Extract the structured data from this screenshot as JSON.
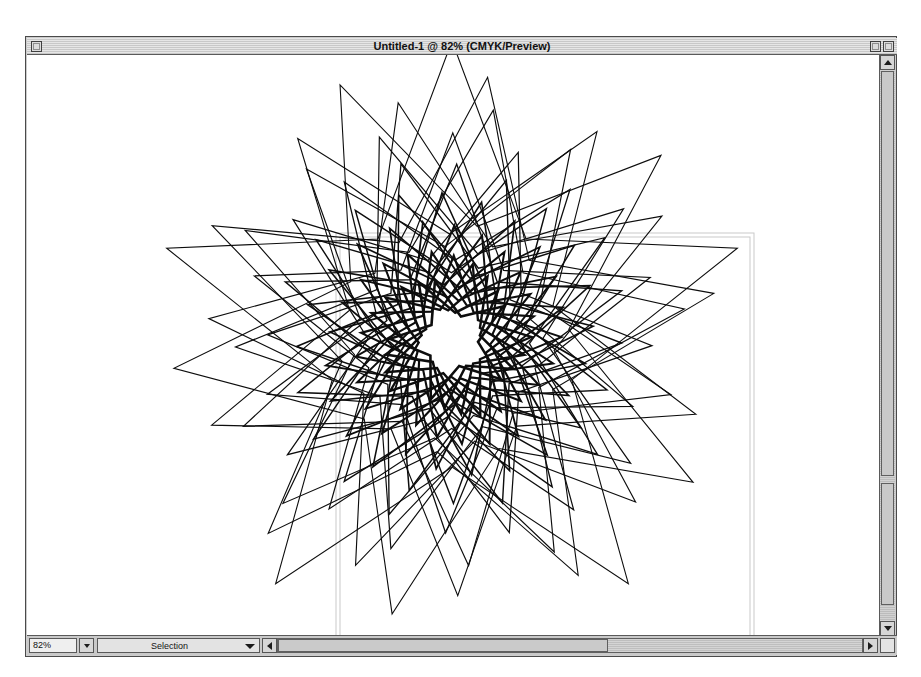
{
  "window": {
    "title": "Untitled-1 @ 82% (CMYK/Preview)",
    "document_name": "Untitled-1",
    "zoom_in_title": "82%",
    "color_mode": "CMYK",
    "view_mode": "Preview",
    "close_box_label": "",
    "zoom_box_label": "",
    "collapse_box_label": ""
  },
  "status_bar": {
    "zoom_value": "82%",
    "zoom_placeholder": "82%",
    "zoom_popup_label": "",
    "info_popup_value": "Selection",
    "info_popup_options": [
      "Selection",
      "Tool",
      "Date and Time",
      "Free Memory",
      "Number of Undos"
    ],
    "grow_box_label": ""
  },
  "scrollbars": {
    "vertical_up_label": "",
    "vertical_down_label": "",
    "horizontal_left_label": "",
    "horizontal_right_label": ""
  },
  "colors": {
    "artwork_stroke": "#0d0d0d",
    "page_guide": "#c9c9c9",
    "canvas_background": "#ffffff",
    "window_chrome": "#cdcdcd",
    "title_bar": "#d7d7d7",
    "frame_border": "#4a4a4a"
  },
  "artwork": {
    "type": "star-spiral-blend",
    "description": "Concentric five-pointed star outlines rotated and scaled from a large outer star down to a small central star",
    "points": 5,
    "step_count": 30,
    "center_x": 451,
    "center_y": 340,
    "outer_radius": 300,
    "inner_radius_ratio": 0.42,
    "final_outer_radius": 62,
    "total_rotation_deg": 560,
    "stroke_width_outer": 1.1,
    "stroke_width_inner": 2.6
  },
  "page_guides": {
    "page_rect": {
      "x": 335,
      "y": 232,
      "width": 418,
      "height": 386
    },
    "margin_rect": {
      "x": 339,
      "y": 236,
      "width": 410,
      "height": 382
    }
  }
}
